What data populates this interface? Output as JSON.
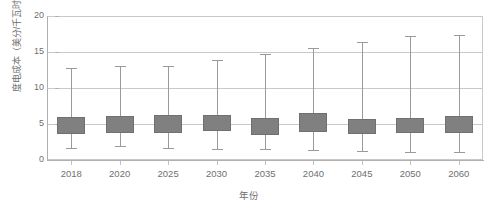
{
  "chart_data": {
    "type": "bar",
    "subtype": "box-whisker",
    "title": "",
    "xlabel": "年份",
    "ylabel": "度电成本（美分/千瓦时）",
    "categories": [
      "2018",
      "2020",
      "2025",
      "2030",
      "2035",
      "2040",
      "2045",
      "2050",
      "2060"
    ],
    "ylim": [
      0,
      20
    ],
    "yticks": [
      "0",
      "5",
      "10",
      "15",
      "20"
    ],
    "ytick_values": [
      0,
      5,
      10,
      15,
      20
    ],
    "grid": true,
    "legend": false,
    "series": [
      {
        "name": "度电成本",
        "box_upper": [
          6.0,
          6.1,
          6.2,
          6.3,
          5.8,
          6.5,
          5.7,
          5.8,
          6.1
        ],
        "box_lower": [
          3.6,
          3.8,
          3.7,
          4.0,
          3.5,
          3.9,
          3.6,
          3.7,
          3.8
        ],
        "whisker_high": [
          12.8,
          13.1,
          13.1,
          13.9,
          14.7,
          15.5,
          16.4,
          17.2,
          17.4
        ],
        "whisker_low": [
          1.7,
          1.9,
          1.6,
          1.5,
          1.5,
          1.4,
          1.3,
          1.1,
          1.1
        ]
      }
    ],
    "colors": {
      "box_fill": "#808080",
      "box_stroke": "#707070",
      "whisker": "#9a9a9a",
      "gridline": "#c9c9c9",
      "axis": "#b0b0b0",
      "tick_text": "#6f6f6f",
      "background": "#ffffff"
    }
  }
}
